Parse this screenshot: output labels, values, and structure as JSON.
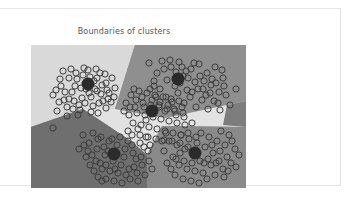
{
  "card": {
    "background": "#ffffff",
    "border_color": "#e3e3e3"
  },
  "chart_data": {
    "type": "scatter",
    "title": "Boundaries of clusters",
    "xlabel": "",
    "ylabel": "",
    "grid": false,
    "legend": false,
    "xlim": [
      0,
      215
    ],
    "ylim": [
      0,
      143
    ],
    "region_colors": {
      "top_left": "#d9d9d9",
      "top_right": "#8f8f8f",
      "center_wedge": "#e2e2e2",
      "bottom_left": "#6f6f6f",
      "bottom_right": "#8a8a8a",
      "far_right": "#7d7d7d"
    },
    "marker": {
      "shape": "open-circle",
      "edge_color": "#3c3c3c",
      "fill": "none",
      "radius": 3.1,
      "stroke_width": 1.0
    },
    "centroid": {
      "shape": "filled-circle",
      "color": "#2b2b2b",
      "radius": 6.5
    },
    "n_clusters": 5,
    "clusters": [
      {
        "id": 1,
        "label": "cluster-top-left",
        "centroid": [
          57,
          39
        ],
        "region": "top_left",
        "n_points": 58,
        "spread": 26
      },
      {
        "id": 2,
        "label": "cluster-top-right",
        "centroid": [
          147,
          34
        ],
        "region": "top_right",
        "n_points": 56,
        "spread": 26
      },
      {
        "id": 3,
        "label": "cluster-center",
        "centroid": [
          121,
          66
        ],
        "region": "center_wedge",
        "n_points": 54,
        "spread": 27
      },
      {
        "id": 4,
        "label": "cluster-bottom-left",
        "centroid": [
          83,
          109
        ],
        "region": "bottom_left",
        "n_points": 57,
        "spread": 26
      },
      {
        "id": 5,
        "label": "cluster-bottom-right",
        "centroid": [
          164,
          108
        ],
        "region": "bottom_right",
        "n_points": 55,
        "spread": 26
      }
    ],
    "points": [
      [
        22,
        50
      ],
      [
        30,
        41
      ],
      [
        33,
        55
      ],
      [
        26,
        66
      ],
      [
        38,
        33
      ],
      [
        41,
        47
      ],
      [
        45,
        28
      ],
      [
        48,
        60
      ],
      [
        52,
        30
      ],
      [
        55,
        44
      ],
      [
        57,
        25
      ],
      [
        60,
        52
      ],
      [
        63,
        36
      ],
      [
        66,
        46
      ],
      [
        69,
        28
      ],
      [
        72,
        56
      ],
      [
        75,
        38
      ],
      [
        78,
        48
      ],
      [
        81,
        33
      ],
      [
        47,
        70
      ],
      [
        36,
        62
      ],
      [
        29,
        34
      ],
      [
        43,
        56
      ],
      [
        50,
        43
      ],
      [
        54,
        58
      ],
      [
        58,
        48
      ],
      [
        62,
        61
      ],
      [
        66,
        33
      ],
      [
        70,
        49
      ],
      [
        74,
        29
      ],
      [
        40,
        24
      ],
      [
        34,
        47
      ],
      [
        28,
        57
      ],
      [
        53,
        23
      ],
      [
        60,
        67
      ],
      [
        68,
        58
      ],
      [
        76,
        45
      ],
      [
        80,
        57
      ],
      [
        84,
        43
      ],
      [
        22,
        83
      ],
      [
        44,
        41
      ],
      [
        51,
        53
      ],
      [
        56,
        37
      ],
      [
        64,
        44
      ],
      [
        71,
        40
      ],
      [
        46,
        34
      ],
      [
        38,
        54
      ],
      [
        32,
        26
      ],
      [
        59,
        32
      ],
      [
        67,
        68
      ],
      [
        75,
        63
      ],
      [
        83,
        52
      ],
      [
        49,
        65
      ],
      [
        42,
        64
      ],
      [
        77,
        54
      ],
      [
        25,
        45
      ],
      [
        36,
        71
      ],
      [
        65,
        24
      ],
      [
        118,
        18
      ],
      [
        126,
        28
      ],
      [
        131,
        16
      ],
      [
        136,
        35
      ],
      [
        140,
        22
      ],
      [
        144,
        41
      ],
      [
        148,
        17
      ],
      [
        152,
        31
      ],
      [
        156,
        45
      ],
      [
        160,
        24
      ],
      [
        164,
        37
      ],
      [
        168,
        19
      ],
      [
        172,
        44
      ],
      [
        176,
        28
      ],
      [
        180,
        40
      ],
      [
        184,
        22
      ],
      [
        188,
        47
      ],
      [
        192,
        33
      ],
      [
        129,
        44
      ],
      [
        135,
        52
      ],
      [
        141,
        57
      ],
      [
        147,
        48
      ],
      [
        153,
        58
      ],
      [
        159,
        52
      ],
      [
        165,
        62
      ],
      [
        171,
        55
      ],
      [
        177,
        64
      ],
      [
        183,
        56
      ],
      [
        189,
        65
      ],
      [
        195,
        50
      ],
      [
        123,
        36
      ],
      [
        133,
        24
      ],
      [
        139,
        15
      ],
      [
        145,
        27
      ],
      [
        151,
        22
      ],
      [
        157,
        33
      ],
      [
        163,
        18
      ],
      [
        169,
        31
      ],
      [
        175,
        50
      ],
      [
        181,
        34
      ],
      [
        187,
        58
      ],
      [
        193,
        41
      ],
      [
        199,
        60
      ],
      [
        205,
        44
      ],
      [
        128,
        60
      ],
      [
        134,
        66
      ],
      [
        125,
        52
      ],
      [
        143,
        64
      ],
      [
        149,
        38
      ],
      [
        155,
        26
      ],
      [
        161,
        47
      ],
      [
        167,
        44
      ],
      [
        173,
        36
      ],
      [
        179,
        48
      ],
      [
        185,
        38
      ],
      [
        191,
        25
      ],
      [
        95,
        58
      ],
      [
        100,
        50
      ],
      [
        104,
        62
      ],
      [
        108,
        46
      ],
      [
        112,
        58
      ],
      [
        116,
        48
      ],
      [
        120,
        60
      ],
      [
        124,
        50
      ],
      [
        128,
        62
      ],
      [
        132,
        52
      ],
      [
        136,
        64
      ],
      [
        140,
        54
      ],
      [
        144,
        66
      ],
      [
        148,
        56
      ],
      [
        152,
        68
      ],
      [
        98,
        70
      ],
      [
        102,
        78
      ],
      [
        106,
        68
      ],
      [
        110,
        80
      ],
      [
        114,
        70
      ],
      [
        118,
        82
      ],
      [
        122,
        72
      ],
      [
        126,
        84
      ],
      [
        130,
        74
      ],
      [
        134,
        86
      ],
      [
        138,
        76
      ],
      [
        142,
        88
      ],
      [
        146,
        78
      ],
      [
        150,
        90
      ],
      [
        154,
        80
      ],
      [
        93,
        66
      ],
      [
        97,
        86
      ],
      [
        101,
        90
      ],
      [
        105,
        55
      ],
      [
        109,
        90
      ],
      [
        113,
        62
      ],
      [
        117,
        92
      ],
      [
        121,
        55
      ],
      [
        125,
        94
      ],
      [
        129,
        57
      ],
      [
        133,
        95
      ],
      [
        137,
        60
      ],
      [
        141,
        96
      ],
      [
        145,
        70
      ],
      [
        149,
        98
      ],
      [
        153,
        72
      ],
      [
        157,
        88
      ],
      [
        161,
        78
      ],
      [
        119,
        44
      ],
      [
        123,
        41
      ],
      [
        111,
        52
      ],
      [
        115,
        75
      ],
      [
        107,
        84
      ],
      [
        103,
        44
      ],
      [
        99,
        62
      ],
      [
        151,
        62
      ],
      [
        52,
        90
      ],
      [
        58,
        98
      ],
      [
        62,
        88
      ],
      [
        66,
        104
      ],
      [
        70,
        92
      ],
      [
        74,
        110
      ],
      [
        78,
        96
      ],
      [
        82,
        116
      ],
      [
        86,
        100
      ],
      [
        90,
        120
      ],
      [
        94,
        104
      ],
      [
        98,
        124
      ],
      [
        102,
        108
      ],
      [
        106,
        128
      ],
      [
        110,
        112
      ],
      [
        114,
        130
      ],
      [
        118,
        116
      ],
      [
        55,
        112
      ],
      [
        59,
        120
      ],
      [
        63,
        126
      ],
      [
        67,
        132
      ],
      [
        71,
        124
      ],
      [
        75,
        134
      ],
      [
        79,
        126
      ],
      [
        83,
        136
      ],
      [
        87,
        128
      ],
      [
        91,
        138
      ],
      [
        95,
        130
      ],
      [
        99,
        134
      ],
      [
        103,
        122
      ],
      [
        48,
        104
      ],
      [
        53,
        100
      ],
      [
        57,
        106
      ],
      [
        61,
        110
      ],
      [
        65,
        116
      ],
      [
        69,
        118
      ],
      [
        73,
        102
      ],
      [
        77,
        106
      ],
      [
        81,
        94
      ],
      [
        85,
        108
      ],
      [
        89,
        92
      ],
      [
        93,
        112
      ],
      [
        97,
        96
      ],
      [
        101,
        100
      ],
      [
        105,
        114
      ],
      [
        109,
        98
      ],
      [
        113,
        102
      ],
      [
        117,
        106
      ],
      [
        121,
        124
      ],
      [
        107,
        136
      ],
      [
        111,
        120
      ],
      [
        115,
        92
      ],
      [
        119,
        100
      ],
      [
        67,
        94
      ],
      [
        71,
        136
      ],
      [
        75,
        120
      ],
      [
        84,
        124
      ],
      [
        133,
        106
      ],
      [
        138,
        96
      ],
      [
        142,
        112
      ],
      [
        146,
        100
      ],
      [
        150,
        90
      ],
      [
        154,
        104
      ],
      [
        158,
        94
      ],
      [
        162,
        110
      ],
      [
        166,
        98
      ],
      [
        170,
        88
      ],
      [
        174,
        102
      ],
      [
        178,
        92
      ],
      [
        182,
        108
      ],
      [
        186,
        96
      ],
      [
        190,
        86
      ],
      [
        194,
        100
      ],
      [
        198,
        90
      ],
      [
        136,
        118
      ],
      [
        140,
        124
      ],
      [
        144,
        130
      ],
      [
        148,
        120
      ],
      [
        152,
        134
      ],
      [
        156,
        124
      ],
      [
        160,
        136
      ],
      [
        164,
        126
      ],
      [
        168,
        138
      ],
      [
        172,
        128
      ],
      [
        176,
        134
      ],
      [
        180,
        120
      ],
      [
        184,
        130
      ],
      [
        188,
        116
      ],
      [
        192,
        124
      ],
      [
        196,
        112
      ],
      [
        200,
        118
      ],
      [
        204,
        104
      ],
      [
        208,
        110
      ],
      [
        131,
        96
      ],
      [
        135,
        88
      ],
      [
        145,
        114
      ],
      [
        149,
        108
      ],
      [
        153,
        116
      ],
      [
        157,
        102
      ],
      [
        161,
        118
      ],
      [
        165,
        92
      ],
      [
        169,
        116
      ],
      [
        173,
        118
      ],
      [
        177,
        114
      ],
      [
        181,
        100
      ],
      [
        185,
        118
      ],
      [
        189,
        106
      ],
      [
        193,
        132
      ],
      [
        197,
        126
      ],
      [
        201,
        96
      ],
      [
        205,
        122
      ]
    ]
  }
}
